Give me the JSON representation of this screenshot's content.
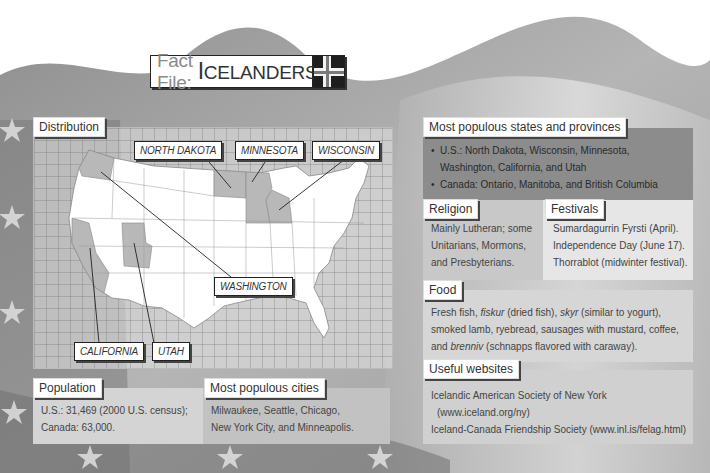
{
  "title": {
    "prefix": "Fact File:",
    "main_first": "I",
    "main_rest": "CELANDERS",
    "flag_icon": "iceland-flag-icon"
  },
  "distribution": {
    "label": "Distribution",
    "state_labels": [
      "NORTH DAKOTA",
      "MINNESOTA",
      "WISCONSIN",
      "WASHINGTON",
      "CALIFORNIA",
      "UTAH"
    ]
  },
  "population": {
    "label": "Population",
    "lines": [
      "U.S.: 31,469 (2000 U.S. census);",
      "Canada: 63,000."
    ]
  },
  "cities": {
    "label": "Most populous cities",
    "lines": [
      "Milwaukee, Seattle, Chicago,",
      "New York City, and Minneapolis."
    ]
  },
  "states": {
    "label": "Most populous states and provinces",
    "items": [
      "U.S.: North Dakota, Wisconsin, Minnesota, Washington, California, and Utah",
      "Canada: Ontario, Manitoba, and British Columbia"
    ]
  },
  "religion": {
    "label": "Religion",
    "lines": [
      "Mainly Lutheran; some",
      "Unitarians, Mormons,",
      "and Presbyterians."
    ]
  },
  "festivals": {
    "label": "Festivals",
    "lines": [
      "Sumardagurrin Fyrsti (April).",
      "Independence Day (June 17).",
      "Thorrablot (midwinter festival)."
    ]
  },
  "food": {
    "label": "Food",
    "parts": {
      "a": "Fresh fish, ",
      "b": "fiskur",
      "c": " (dried fish), ",
      "d": "skyr",
      "e": " (similar to yogurt),",
      "f": "smoked lamb, ryebread, sausages with mustard, coffee,",
      "g": "and ",
      "h": "brenniv",
      "i": " (schnapps flavored with caraway)."
    }
  },
  "websites": {
    "label": "Useful websites",
    "lines": [
      "Icelandic American Society of New York",
      "(www.iceland.org/ny)",
      "Iceland-Canada Friendship Society (www.inl.is/felag.html)"
    ]
  },
  "colors": {
    "states_box": "#8c8c8c",
    "religion_box": "#c8c8c8",
    "festivals_box": "#e6e6e6",
    "food_box": "#d6d6d6",
    "websites_box": "#d0d0d0",
    "population_box": "#d4d4d4",
    "cities_box": "#c2c2c2"
  }
}
